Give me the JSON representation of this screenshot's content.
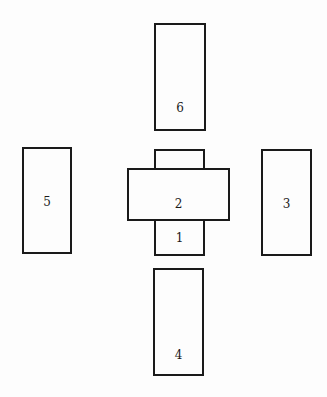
{
  "diagram": {
    "type": "card-spread-layout",
    "cards": [
      {
        "id": "1",
        "label": "1",
        "x": 154,
        "y": 149,
        "w": 51,
        "h": 107,
        "label_y": 80
      },
      {
        "id": "2",
        "label": "2",
        "x": 127,
        "y": 168,
        "w": 103,
        "h": 53,
        "label_y": 27
      },
      {
        "id": "3",
        "label": "3",
        "x": 261,
        "y": 149,
        "w": 51,
        "h": 107,
        "label_y": 46
      },
      {
        "id": "4",
        "label": "4",
        "x": 153,
        "y": 268,
        "w": 51,
        "h": 108,
        "label_y": 78
      },
      {
        "id": "5",
        "label": "5",
        "x": 22,
        "y": 147,
        "w": 50,
        "h": 107,
        "label_y": 46
      },
      {
        "id": "6",
        "label": "6",
        "x": 154,
        "y": 23,
        "w": 52,
        "h": 108,
        "label_y": 76
      }
    ]
  }
}
